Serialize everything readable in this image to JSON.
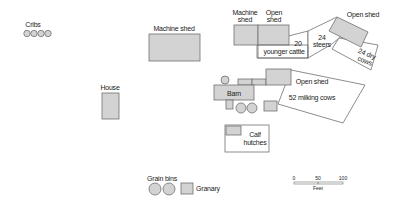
{
  "diagram": {
    "colors": {
      "building_fill": "#d3d3d3",
      "outline": "#707070",
      "pen_fill": "#ffffff",
      "text": "#222222"
    },
    "labels": {
      "cribs": "Cribs",
      "machine_shed_main": "Machine shed",
      "house": "House",
      "machine_shed_small_1": "Machine",
      "machine_shed_small_2": "shed",
      "open_shed_top_1": "Open",
      "open_shed_top_2": "shed",
      "younger_cattle_1": "20",
      "younger_cattle_2": "younger cattle",
      "steers_1": "24",
      "steers_2": "steers",
      "open_shed_angled": "Open shed",
      "dry_cows_1": "24 dry",
      "dry_cows_2": "cows",
      "barn": "Barn",
      "open_shed_barn": "Open shed",
      "milking_cows": "52 milking cows",
      "calf_hutches_1": "Calf",
      "calf_hutches_2": "hutches",
      "grain_bins": "Grain bins",
      "granary": "Granary"
    },
    "scale": {
      "ticks": [
        "0",
        "50",
        "100"
      ],
      "unit": "Feet"
    },
    "nodes": [
      {
        "id": "cribs",
        "type": "circles",
        "count": 4
      },
      {
        "id": "machine-shed-main",
        "type": "building"
      },
      {
        "id": "house",
        "type": "building"
      },
      {
        "id": "machine-shed-small",
        "type": "building"
      },
      {
        "id": "open-shed-top",
        "type": "building"
      },
      {
        "id": "younger-cattle-pen",
        "type": "pen",
        "animals": "20 younger cattle"
      },
      {
        "id": "steers-pen",
        "type": "pen",
        "animals": "24 steers"
      },
      {
        "id": "open-shed-angled",
        "type": "building"
      },
      {
        "id": "dry-cows-pen",
        "type": "pen",
        "animals": "24 dry cows"
      },
      {
        "id": "barn",
        "type": "building"
      },
      {
        "id": "open-shed-barn",
        "type": "building"
      },
      {
        "id": "milking-cows-pen",
        "type": "pen",
        "animals": "52 milking cows"
      },
      {
        "id": "calf-hutches",
        "type": "pen"
      },
      {
        "id": "grain-bins",
        "type": "circles",
        "count": 2
      },
      {
        "id": "granary",
        "type": "building"
      }
    ]
  }
}
